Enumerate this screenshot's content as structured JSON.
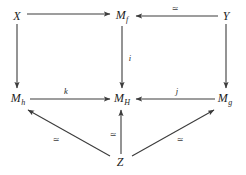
{
  "diagram": {
    "type": "commutative-diagram",
    "width": 246,
    "height": 175,
    "background_color": "#ffffff",
    "line_color": "#3c3c3c",
    "text_color": "#1d1d1d",
    "nodes": [
      {
        "id": "X",
        "base": "X",
        "sub": "",
        "x": 17,
        "y": 16
      },
      {
        "id": "Mf",
        "base": "M",
        "sub": "f",
        "x": 122,
        "y": 16
      },
      {
        "id": "Y",
        "base": "Y",
        "sub": "",
        "x": 226,
        "y": 16
      },
      {
        "id": "Mh",
        "base": "M",
        "sub": "h",
        "x": 18,
        "y": 99
      },
      {
        "id": "MH",
        "base": "M",
        "sub": "H",
        "x": 122,
        "y": 99
      },
      {
        "id": "Mg",
        "base": "M",
        "sub": "g",
        "x": 225,
        "y": 99
      },
      {
        "id": "Z",
        "base": "Z",
        "sub": "",
        "x": 120,
        "y": 162
      }
    ],
    "edges": [
      {
        "id": "X-to-Mf",
        "from": "X",
        "to": "Mf",
        "label": "",
        "label_kind": "none"
      },
      {
        "id": "Y-to-Mf",
        "from": "Y",
        "to": "Mf",
        "label": "≃",
        "label_kind": "equivalence"
      },
      {
        "id": "X-to-Mh",
        "from": "X",
        "to": "Mh",
        "label": "",
        "label_kind": "none"
      },
      {
        "id": "Mf-to-MH",
        "from": "Mf",
        "to": "MH",
        "label": "i",
        "label_kind": "map"
      },
      {
        "id": "Y-to-Mg",
        "from": "Y",
        "to": "Mg",
        "label": "",
        "label_kind": "none"
      },
      {
        "id": "Mh-to-MH",
        "from": "Mh",
        "to": "MH",
        "label": "k",
        "label_kind": "map"
      },
      {
        "id": "Mg-to-MH",
        "from": "Mg",
        "to": "MH",
        "label": "j",
        "label_kind": "map"
      },
      {
        "id": "Z-to-Mh",
        "from": "Z",
        "to": "Mh",
        "label": "≃",
        "label_kind": "equivalence"
      },
      {
        "id": "Z-to-MH",
        "from": "Z",
        "to": "MH",
        "label": "≃",
        "label_kind": "equivalence"
      },
      {
        "id": "Z-to-Mg",
        "from": "Z",
        "to": "Mg",
        "label": "≃",
        "label_kind": "equivalence"
      }
    ],
    "edge_labels": [
      {
        "id": "label-Y-to-Mf",
        "text": "≃",
        "x": 175,
        "y": 9,
        "kind": "equivalence"
      },
      {
        "id": "label-Mf-to-MH",
        "text": "i",
        "x": 130,
        "y": 58,
        "kind": "map"
      },
      {
        "id": "label-Mh-to-MH",
        "text": "k",
        "x": 66,
        "y": 91,
        "kind": "map"
      },
      {
        "id": "label-Mg-to-MH",
        "text": "j",
        "x": 177,
        "y": 91,
        "kind": "map"
      },
      {
        "id": "label-Z-to-Mh",
        "text": "≃",
        "x": 56,
        "y": 140,
        "kind": "equivalence"
      },
      {
        "id": "label-Z-to-MH",
        "text": "≃",
        "x": 113,
        "y": 135,
        "kind": "equivalence"
      },
      {
        "id": "label-Z-to-Mg",
        "text": "≃",
        "x": 180,
        "y": 140,
        "kind": "equivalence"
      }
    ]
  }
}
